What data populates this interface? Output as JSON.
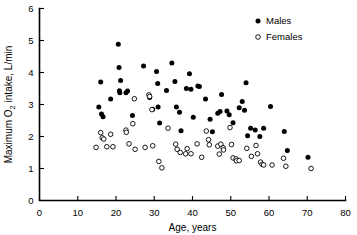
{
  "chart_data": {
    "type": "scatter",
    "title": "",
    "xlabel": "Age, years",
    "ylabel": "Maximum O2 intake, L/min",
    "ylabel_parts": {
      "pre": "Maximum O",
      "sub": "2",
      "post": " intake, L/min"
    },
    "xlim": [
      0,
      80
    ],
    "ylim": [
      0,
      6
    ],
    "xticks": [
      0,
      10,
      20,
      30,
      40,
      50,
      60,
      70,
      80
    ],
    "yticks": [
      0,
      1,
      2,
      3,
      4,
      5,
      6
    ],
    "grid": false,
    "legend_position": "top-right",
    "series": [
      {
        "name": "Males",
        "marker": "filled-circle",
        "color": "#000000",
        "points": [
          [
            15.5,
            2.92
          ],
          [
            16.0,
            3.7
          ],
          [
            16.2,
            2.7
          ],
          [
            16.6,
            2.62
          ],
          [
            18.6,
            3.17
          ],
          [
            20.6,
            4.88
          ],
          [
            20.8,
            4.16
          ],
          [
            20.9,
            3.43
          ],
          [
            21.0,
            3.37
          ],
          [
            21.2,
            3.75
          ],
          [
            22.6,
            3.37
          ],
          [
            23.0,
            3.42
          ],
          [
            24.3,
            2.66
          ],
          [
            27.2,
            4.2
          ],
          [
            28.8,
            3.22
          ],
          [
            29.6,
            2.85
          ],
          [
            30.6,
            4.03
          ],
          [
            30.9,
            3.66
          ],
          [
            31.0,
            2.92
          ],
          [
            31.4,
            2.42
          ],
          [
            33.2,
            3.44
          ],
          [
            34.6,
            4.3
          ],
          [
            35.4,
            3.72
          ],
          [
            35.8,
            2.92
          ],
          [
            36.6,
            2.76
          ],
          [
            37.0,
            2.18
          ],
          [
            38.4,
            3.5
          ],
          [
            39.2,
            3.96
          ],
          [
            39.6,
            3.48
          ],
          [
            40.2,
            2.6
          ],
          [
            41.4,
            3.58
          ],
          [
            41.8,
            3.56
          ],
          [
            43.4,
            3.17
          ],
          [
            44.6,
            2.54
          ],
          [
            45.2,
            2.15
          ],
          [
            46.6,
            2.73
          ],
          [
            47.2,
            2.78
          ],
          [
            47.6,
            3.31
          ],
          [
            49.0,
            2.8
          ],
          [
            49.6,
            2.68
          ],
          [
            50.6,
            2.43
          ],
          [
            52.2,
            2.9
          ],
          [
            53.0,
            3.09
          ],
          [
            53.6,
            2.82
          ],
          [
            54.0,
            3.68
          ],
          [
            54.4,
            2.02
          ],
          [
            55.2,
            2.26
          ],
          [
            56.4,
            2.2
          ],
          [
            57.6,
            2.0
          ],
          [
            58.6,
            2.26
          ],
          [
            60.4,
            2.94
          ],
          [
            64.0,
            2.16
          ],
          [
            64.8,
            1.56
          ],
          [
            70.2,
            1.35
          ]
        ]
      },
      {
        "name": "Females",
        "marker": "open-circle",
        "color": "#000000",
        "points": [
          [
            14.8,
            1.66
          ],
          [
            16.0,
            2.12
          ],
          [
            16.4,
            1.96
          ],
          [
            16.8,
            1.92
          ],
          [
            17.6,
            1.68
          ],
          [
            18.6,
            2.07
          ],
          [
            19.2,
            1.68
          ],
          [
            22.6,
            2.2
          ],
          [
            22.7,
            2.13
          ],
          [
            23.4,
            1.77
          ],
          [
            24.4,
            2.4
          ],
          [
            24.8,
            3.18
          ],
          [
            25.0,
            1.6
          ],
          [
            27.6,
            1.66
          ],
          [
            28.6,
            3.3
          ],
          [
            28.8,
            3.25
          ],
          [
            29.4,
            2.84
          ],
          [
            29.6,
            1.71
          ],
          [
            31.2,
            1.22
          ],
          [
            32.0,
            1.02
          ],
          [
            33.6,
            2.26
          ],
          [
            35.6,
            1.76
          ],
          [
            36.0,
            1.6
          ],
          [
            36.8,
            1.5
          ],
          [
            38.2,
            1.46
          ],
          [
            38.6,
            1.62
          ],
          [
            39.6,
            1.46
          ],
          [
            41.2,
            1.77
          ],
          [
            42.4,
            1.35
          ],
          [
            43.6,
            2.17
          ],
          [
            44.2,
            1.9
          ],
          [
            44.4,
            1.74
          ],
          [
            46.6,
            1.7
          ],
          [
            47.0,
            1.45
          ],
          [
            47.4,
            1.76
          ],
          [
            48.0,
            1.65
          ],
          [
            48.1,
            1.58
          ],
          [
            49.8,
            2.28
          ],
          [
            50.2,
            1.75
          ],
          [
            50.6,
            1.33
          ],
          [
            51.4,
            1.3
          ],
          [
            51.5,
            1.24
          ],
          [
            52.2,
            1.25
          ],
          [
            54.2,
            1.63
          ],
          [
            55.4,
            1.38
          ],
          [
            56.6,
            1.72
          ],
          [
            57.0,
            1.46
          ],
          [
            57.8,
            1.2
          ],
          [
            58.2,
            1.13
          ],
          [
            58.6,
            1.11
          ],
          [
            60.8,
            1.11
          ],
          [
            63.8,
            1.32
          ],
          [
            64.4,
            1.07
          ],
          [
            71.0,
            1.0
          ]
        ]
      }
    ]
  },
  "legend": {
    "items": [
      {
        "label": "Males",
        "marker": "filled-circle"
      },
      {
        "label": "Females",
        "marker": "open-circle"
      }
    ]
  }
}
